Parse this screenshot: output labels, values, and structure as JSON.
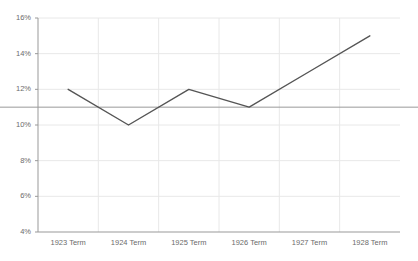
{
  "chart_data": {
    "type": "line",
    "title": "",
    "subtitle": "",
    "xlabel": "",
    "ylabel": "",
    "categories": [
      "1923 Term",
      "1924 Term",
      "1925 Term",
      "1926 Term",
      "1927 Term",
      "1928 Term"
    ],
    "values": [
      12,
      10,
      12,
      11,
      13,
      15
    ],
    "series": [
      {
        "name": "",
        "values": [
          12,
          10,
          12,
          11,
          13,
          15
        ],
        "color": "#555555"
      }
    ],
    "ylim": [
      4,
      16
    ],
    "ytick_values": [
      4,
      6,
      8,
      10,
      12,
      14,
      16
    ],
    "ytick_labels": [
      "4%",
      "6%",
      "8%",
      "10%",
      "12%",
      "14%",
      "16%"
    ],
    "xtick_labels": [
      "1923 Term",
      "1924 Term",
      "1925 Term",
      "1926 Term",
      "1927 Term",
      "1928 Term"
    ],
    "reference_line": {
      "value": 11,
      "label": "",
      "color": "#9a9a9a"
    },
    "grid": {
      "horizontal": true,
      "vertical": true,
      "color": "#e8e8e8"
    },
    "legend": {
      "visible": false,
      "position": "none",
      "entries": []
    },
    "axis_color": "#999999",
    "background": "#ffffff"
  }
}
